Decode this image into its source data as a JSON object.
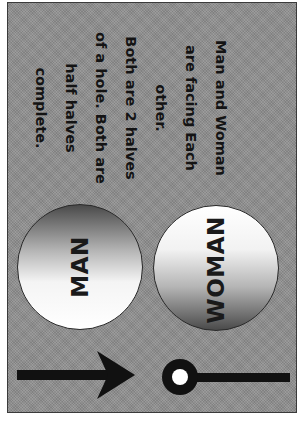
{
  "caption": {
    "lines": [
      "Man and Woman",
      "are facing Each",
      "other.",
      "Both are 2 halves",
      "of a hole. Both are",
      "half halves",
      "complete."
    ]
  },
  "circles": {
    "man": {
      "label": "MAN",
      "gradient": "dark-top-to-white-bottom"
    },
    "woman": {
      "label": "WOMAN",
      "gradient": "white-top-to-dark-bottom"
    }
  },
  "symbols": {
    "man_symbol": "arrow-icon",
    "woman_symbol": "ring-line-icon"
  },
  "colors": {
    "background": "#8f8f8f",
    "ink": "#141414",
    "margin": "#ffffff"
  }
}
